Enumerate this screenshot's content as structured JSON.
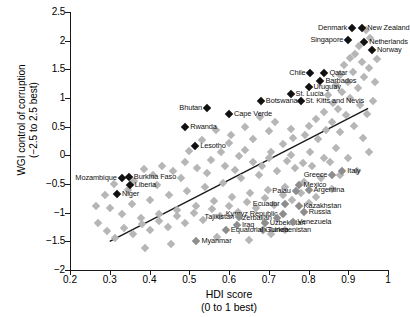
{
  "chart_data": {
    "type": "scatter",
    "title": "",
    "xlabel": "HDI score (0 to 1 best)",
    "xlabel_line1": "HDI score",
    "xlabel_line2": "(0 to 1 best)",
    "ylabel": "WGI control of corruption (−2.5 to 2.5 best)",
    "ylabel_line1": "WGI control of corruption",
    "ylabel_line2": "(−2.5 to 2.5 best)",
    "xlim": [
      0.2,
      1.0
    ],
    "ylim": [
      -2,
      2.5
    ],
    "xticks": [
      "0.2",
      "0.3",
      "0.4",
      "0.5",
      "0.6",
      "0.7",
      "0.8",
      "0.9",
      "1"
    ],
    "xtick_values": [
      0.2,
      0.3,
      0.4,
      0.5,
      0.6,
      0.7,
      0.8,
      0.9,
      1.0
    ],
    "yticks": [
      "2.5",
      "2",
      "1.5",
      "1",
      "0.5",
      "0",
      "−0.5",
      "−1",
      "−1.5",
      "−2"
    ],
    "ytick_values": [
      2.5,
      2,
      1.5,
      1,
      0.5,
      0,
      -0.5,
      -1,
      -1.5,
      -2
    ],
    "grid": false,
    "legend": "none",
    "marker": "diamond",
    "trendline": {
      "x0": 0.3,
      "y0": -1.5,
      "x1": 0.95,
      "y1": 0.82
    },
    "labeled_points": [
      {
        "name": "Denmark",
        "x": 0.91,
        "y": 2.22,
        "side": "r",
        "color": "dark"
      },
      {
        "name": "New Zealand",
        "x": 0.935,
        "y": 2.22,
        "side": "l",
        "color": "dark"
      },
      {
        "name": "Singapore",
        "x": 0.9,
        "y": 2.02,
        "side": "r",
        "color": "dark"
      },
      {
        "name": "Netherlands",
        "x": 0.94,
        "y": 1.98,
        "side": "l",
        "color": "dark"
      },
      {
        "name": "Norway",
        "x": 0.96,
        "y": 1.83,
        "side": "l",
        "color": "dark"
      },
      {
        "name": "Chile",
        "x": 0.805,
        "y": 1.43,
        "side": "r",
        "color": "dark"
      },
      {
        "name": "Qatar",
        "x": 0.84,
        "y": 1.43,
        "side": "l",
        "color": "dark"
      },
      {
        "name": "Barbados",
        "x": 0.83,
        "y": 1.3,
        "side": "l",
        "color": "dark"
      },
      {
        "name": "Uruguay",
        "x": 0.8,
        "y": 1.19,
        "side": "l",
        "color": "dark"
      },
      {
        "name": "St. Lucia",
        "x": 0.755,
        "y": 1.07,
        "side": "l",
        "color": "dark"
      },
      {
        "name": "St. Kitts and Nevis",
        "x": 0.78,
        "y": 0.95,
        "side": "l",
        "color": "dark"
      },
      {
        "name": "Botswana",
        "x": 0.68,
        "y": 0.94,
        "side": "l",
        "color": "dark"
      },
      {
        "name": "Bhutan",
        "x": 0.545,
        "y": 0.82,
        "side": "r",
        "color": "dark"
      },
      {
        "name": "Cape Verde",
        "x": 0.6,
        "y": 0.72,
        "side": "l",
        "color": "dark"
      },
      {
        "name": "Rwanda",
        "x": 0.49,
        "y": 0.5,
        "side": "l",
        "color": "dark"
      },
      {
        "name": "Lesotho",
        "x": 0.515,
        "y": 0.17,
        "side": "l",
        "color": "dark"
      },
      {
        "name": "Burkina Faso",
        "x": 0.348,
        "y": -0.38,
        "side": "l",
        "color": "dark"
      },
      {
        "name": "Mozambique",
        "x": 0.33,
        "y": -0.39,
        "side": "r",
        "color": "dark"
      },
      {
        "name": "Liberia",
        "x": 0.35,
        "y": -0.52,
        "side": "l",
        "color": "dark"
      },
      {
        "name": "Niger",
        "x": 0.318,
        "y": -0.68,
        "side": "l",
        "color": "dark"
      },
      {
        "name": "Italy",
        "x": 0.885,
        "y": -0.27,
        "side": "l",
        "color": "lab-grey"
      },
      {
        "name": "Greece",
        "x": 0.86,
        "y": -0.35,
        "side": "r",
        "color": "lab-grey"
      },
      {
        "name": "Mexico",
        "x": 0.775,
        "y": -0.51,
        "side": "l",
        "color": "lab-grey"
      },
      {
        "name": "Argentina",
        "x": 0.8,
        "y": -0.6,
        "side": "l",
        "color": "lab-grey"
      },
      {
        "name": "Palau",
        "x": 0.768,
        "y": -0.62,
        "side": "r",
        "color": "lab-grey"
      },
      {
        "name": "Ecuador",
        "x": 0.74,
        "y": -0.85,
        "side": "r",
        "color": "lab-grey"
      },
      {
        "name": "Kazakhstan",
        "x": 0.775,
        "y": -0.88,
        "side": "l",
        "color": "lab-grey"
      },
      {
        "name": "Russia",
        "x": 0.788,
        "y": -0.98,
        "side": "l",
        "color": "lab-grey"
      },
      {
        "name": "Kyrgyz Republic",
        "x": 0.735,
        "y": -1.02,
        "side": "r",
        "color": "lab-grey"
      },
      {
        "name": "Azerbaijan",
        "x": 0.72,
        "y": -1.1,
        "side": "r",
        "color": "lab-grey"
      },
      {
        "name": "Tajikistan",
        "x": 0.625,
        "y": -1.08,
        "side": "r",
        "color": "lab-grey"
      },
      {
        "name": "Uzbekistan",
        "x": 0.69,
        "y": -1.18,
        "side": "l",
        "color": "lab-grey"
      },
      {
        "name": "Venezuela",
        "x": 0.76,
        "y": -1.17,
        "side": "l",
        "color": "lab-grey"
      },
      {
        "name": "Iraq",
        "x": 0.62,
        "y": -1.22,
        "side": "l",
        "color": "lab-grey"
      },
      {
        "name": "Turkmenistan",
        "x": 0.685,
        "y": -1.3,
        "side": "l",
        "color": "lab-grey"
      },
      {
        "name": "Equatorial Guinea",
        "x": 0.592,
        "y": -1.3,
        "side": "l",
        "color": "lab-grey"
      },
      {
        "name": "Myanmar",
        "x": 0.518,
        "y": -1.5,
        "side": "l",
        "color": "lab-grey"
      }
    ],
    "background_points": [
      {
        "x": 0.945,
        "y": 2.18
      },
      {
        "x": 0.955,
        "y": 2.05
      },
      {
        "x": 0.928,
        "y": 1.9
      },
      {
        "x": 0.918,
        "y": 1.77
      },
      {
        "x": 0.905,
        "y": 1.7
      },
      {
        "x": 0.935,
        "y": 1.62
      },
      {
        "x": 0.89,
        "y": 1.58
      },
      {
        "x": 0.952,
        "y": 1.52
      },
      {
        "x": 0.912,
        "y": 1.45
      },
      {
        "x": 0.88,
        "y": 1.4
      },
      {
        "x": 0.94,
        "y": 1.36
      },
      {
        "x": 0.9,
        "y": 1.28
      },
      {
        "x": 0.868,
        "y": 1.22
      },
      {
        "x": 0.925,
        "y": 1.18
      },
      {
        "x": 0.885,
        "y": 1.1
      },
      {
        "x": 0.85,
        "y": 1.05
      },
      {
        "x": 0.905,
        "y": 1.0
      },
      {
        "x": 0.862,
        "y": 0.92
      },
      {
        "x": 0.93,
        "y": 0.88
      },
      {
        "x": 0.875,
        "y": 0.8
      },
      {
        "x": 0.84,
        "y": 0.75
      },
      {
        "x": 0.895,
        "y": 0.7
      },
      {
        "x": 0.82,
        "y": 0.64
      },
      {
        "x": 0.86,
        "y": 0.58
      },
      {
        "x": 0.8,
        "y": 0.52
      },
      {
        "x": 0.845,
        "y": 0.45
      },
      {
        "x": 0.88,
        "y": 0.4
      },
      {
        "x": 0.79,
        "y": 0.35
      },
      {
        "x": 0.825,
        "y": 0.28
      },
      {
        "x": 0.76,
        "y": 0.3
      },
      {
        "x": 0.7,
        "y": 0.42
      },
      {
        "x": 0.735,
        "y": 0.2
      },
      {
        "x": 0.66,
        "y": 0.28
      },
      {
        "x": 0.64,
        "y": 0.1
      },
      {
        "x": 0.6,
        "y": 0.22
      },
      {
        "x": 0.58,
        "y": 0.05
      },
      {
        "x": 0.705,
        "y": 0.05
      },
      {
        "x": 0.755,
        "y": 0.0
      },
      {
        "x": 0.805,
        "y": 0.06
      },
      {
        "x": 0.838,
        "y": -0.05
      },
      {
        "x": 0.87,
        "y": 0.12
      },
      {
        "x": 0.786,
        "y": -0.14
      },
      {
        "x": 0.745,
        "y": -0.1
      },
      {
        "x": 0.7,
        "y": -0.05
      },
      {
        "x": 0.66,
        "y": -0.12
      },
      {
        "x": 0.625,
        "y": -0.02
      },
      {
        "x": 0.59,
        "y": -0.18
      },
      {
        "x": 0.555,
        "y": -0.08
      },
      {
        "x": 0.52,
        "y": -0.22
      },
      {
        "x": 0.49,
        "y": -0.12
      },
      {
        "x": 0.46,
        "y": -0.28
      },
      {
        "x": 0.432,
        "y": -0.18
      },
      {
        "x": 0.408,
        "y": -0.34
      },
      {
        "x": 0.385,
        "y": -0.24
      },
      {
        "x": 0.362,
        "y": -0.44
      },
      {
        "x": 0.3,
        "y": -0.92
      },
      {
        "x": 0.33,
        "y": -1.02
      },
      {
        "x": 0.355,
        "y": -0.85
      },
      {
        "x": 0.378,
        "y": -1.1
      },
      {
        "x": 0.402,
        "y": -0.78
      },
      {
        "x": 0.425,
        "y": -1.02
      },
      {
        "x": 0.448,
        "y": -0.7
      },
      {
        "x": 0.47,
        "y": -0.95
      },
      {
        "x": 0.495,
        "y": -0.62
      },
      {
        "x": 0.518,
        "y": -0.88
      },
      {
        "x": 0.54,
        "y": -0.55
      },
      {
        "x": 0.562,
        "y": -0.8
      },
      {
        "x": 0.585,
        "y": -0.48
      },
      {
        "x": 0.608,
        "y": -0.72
      },
      {
        "x": 0.63,
        "y": -0.4
      },
      {
        "x": 0.652,
        "y": -0.66
      },
      {
        "x": 0.675,
        "y": -0.34
      },
      {
        "x": 0.698,
        "y": -0.6
      },
      {
        "x": 0.72,
        "y": -0.28
      },
      {
        "x": 0.742,
        "y": -0.55
      },
      {
        "x": 0.765,
        "y": -0.22
      },
      {
        "x": 0.788,
        "y": -0.46
      },
      {
        "x": 0.81,
        "y": -0.18
      },
      {
        "x": 0.832,
        "y": -0.4
      },
      {
        "x": 0.855,
        "y": -0.12
      },
      {
        "x": 0.878,
        "y": -0.34
      },
      {
        "x": 0.9,
        "y": -0.05
      },
      {
        "x": 0.922,
        "y": -0.28
      },
      {
        "x": 0.86,
        "y": -0.58
      },
      {
        "x": 0.82,
        "y": -0.72
      },
      {
        "x": 0.8,
        "y": -0.84
      },
      {
        "x": 0.78,
        "y": -0.66
      },
      {
        "x": 0.758,
        "y": -0.78
      },
      {
        "x": 0.735,
        "y": -0.7
      },
      {
        "x": 0.712,
        "y": -0.86
      },
      {
        "x": 0.69,
        "y": -0.74
      },
      {
        "x": 0.668,
        "y": -0.92
      },
      {
        "x": 0.645,
        "y": -0.82
      },
      {
        "x": 0.622,
        "y": -0.98
      },
      {
        "x": 0.6,
        "y": -0.88
      },
      {
        "x": 0.578,
        "y": -1.05
      },
      {
        "x": 0.556,
        "y": -0.94
      },
      {
        "x": 0.534,
        "y": -1.12
      },
      {
        "x": 0.512,
        "y": -1.0
      },
      {
        "x": 0.49,
        "y": -1.18
      },
      {
        "x": 0.468,
        "y": -1.06
      },
      {
        "x": 0.446,
        "y": -1.25
      },
      {
        "x": 0.424,
        "y": -1.14
      },
      {
        "x": 0.402,
        "y": -1.3
      },
      {
        "x": 0.38,
        "y": -1.2
      },
      {
        "x": 0.358,
        "y": -1.38
      },
      {
        "x": 0.336,
        "y": -1.26
      },
      {
        "x": 0.314,
        "y": -1.45
      },
      {
        "x": 0.292,
        "y": -1.32
      },
      {
        "x": 0.27,
        "y": -1.18
      },
      {
        "x": 0.455,
        "y": -1.55
      },
      {
        "x": 0.57,
        "y": -1.42
      },
      {
        "x": 0.65,
        "y": -1.48
      },
      {
        "x": 0.705,
        "y": -1.38
      },
      {
        "x": 0.742,
        "y": -1.3
      },
      {
        "x": 0.388,
        "y": -1.62
      },
      {
        "x": 0.345,
        "y": -0.6
      },
      {
        "x": 0.31,
        "y": -0.5
      },
      {
        "x": 0.288,
        "y": -0.7
      },
      {
        "x": 0.265,
        "y": -0.88
      },
      {
        "x": 0.42,
        "y": -0.52
      },
      {
        "x": 0.48,
        "y": -0.4
      },
      {
        "x": 0.545,
        "y": -0.3
      },
      {
        "x": 0.615,
        "y": -0.25
      },
      {
        "x": 0.682,
        "y": -0.18
      },
      {
        "x": 0.938,
        "y": 0.3
      },
      {
        "x": 0.952,
        "y": 0.05
      },
      {
        "x": 0.915,
        "y": 0.52
      },
      {
        "x": 0.948,
        "y": 0.72
      },
      {
        "x": 0.968,
        "y": 1.28
      },
      {
        "x": 0.962,
        "y": 0.95
      },
      {
        "x": 0.972,
        "y": 1.68
      },
      {
        "x": 0.755,
        "y": 0.46
      },
      {
        "x": 0.715,
        "y": 0.58
      },
      {
        "x": 0.678,
        "y": 0.66
      },
      {
        "x": 0.64,
        "y": 0.5
      },
      {
        "x": 0.605,
        "y": 0.36
      },
      {
        "x": 0.568,
        "y": 0.44
      },
      {
        "x": 0.532,
        "y": 0.26
      },
      {
        "x": 0.5,
        "y": 0.08
      }
    ]
  }
}
